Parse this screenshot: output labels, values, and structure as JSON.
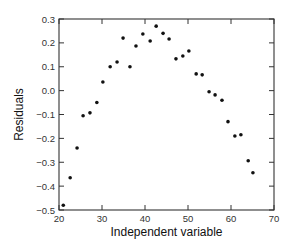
{
  "chart_data": {
    "type": "scatter",
    "title": "",
    "xlabel": "Independent variable",
    "ylabel": "Residuals",
    "xlim": [
      20,
      70
    ],
    "ylim": [
      -0.5,
      0.3
    ],
    "grid": false,
    "legend": null,
    "x_ticks": [
      20,
      30,
      40,
      50,
      60,
      70
    ],
    "x_tick_labels": [
      "20",
      "30",
      "40",
      "50",
      "60",
      "70"
    ],
    "y_ticks": [
      -0.5,
      -0.4,
      -0.3,
      -0.2,
      -0.1,
      0.0,
      0.1,
      0.2,
      0.3
    ],
    "y_tick_labels": [
      "−0.5",
      "−0.4",
      "−0.3",
      "−0.2",
      "−0.1",
      "0.0",
      "0.1",
      "0.2",
      "0.3"
    ],
    "series": [
      {
        "name": "residuals",
        "marker": "dot",
        "color": "#111111",
        "x": [
          21.0,
          22.6,
          24.2,
          25.6,
          27.2,
          28.8,
          30.2,
          31.9,
          33.5,
          34.9,
          36.5,
          37.9,
          39.5,
          41.2,
          42.6,
          44.2,
          45.6,
          47.2,
          48.8,
          50.2,
          51.9,
          53.3,
          54.9,
          56.3,
          57.9,
          59.3,
          60.9,
          62.3,
          64.0,
          65.1
        ],
        "y": [
          -0.48,
          -0.365,
          -0.24,
          -0.105,
          -0.093,
          -0.05,
          0.036,
          0.1,
          0.12,
          0.22,
          0.1,
          0.187,
          0.237,
          0.208,
          0.27,
          0.24,
          0.216,
          0.133,
          0.145,
          0.166,
          0.07,
          0.066,
          -0.005,
          -0.018,
          -0.04,
          -0.13,
          -0.19,
          -0.185,
          -0.294,
          -0.344
        ]
      }
    ]
  },
  "layout": {
    "plot_left": 59,
    "plot_right": 274,
    "plot_top": 19,
    "plot_bottom": 210
  }
}
